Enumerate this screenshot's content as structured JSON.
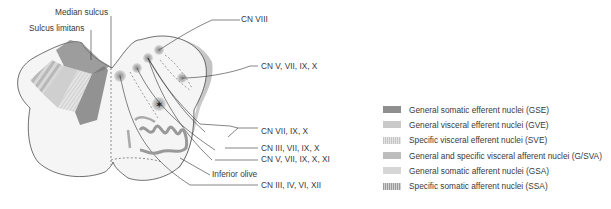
{
  "labels": {
    "median_sulcus": "Median sulcus",
    "sulcus_limitans": "Sulcus limitans",
    "cn_viii": "CN VIII",
    "cn_v_vii_ix_x": "CN V, VII, IX, X",
    "cn_vii_ix_x": "CN VII, IX, X",
    "cn_iii_vii_ix_x": "CN III, VII, IX, X",
    "cn_v_vii_ix_x_xi": "CN V, VII, IX, X, XI",
    "inferior_olive": "Inferior olive",
    "cn_iii_iv_vi_xii": "CN III, IV, VI, XII"
  },
  "legend": {
    "items": [
      {
        "label": "General somatic efferent nuclei (GSE)",
        "color": "#8f8f8f"
      },
      {
        "label": "General visceral efferent nuclei (GVE)",
        "color": "#c9c9c9"
      },
      {
        "label": "Specific visceral efferent nuclei (SVE)",
        "color": "#d5d5d5"
      },
      {
        "label": "General and specific visceral afferent nuclei (G/SVA)",
        "color": "#bdbdbd"
      },
      {
        "label": "General somatic afferent nuclei (GSA)",
        "color": "#d6d6d6"
      },
      {
        "label": "Specific somatic afferent nuclei (SSA)",
        "color": "#b5b5b5"
      }
    ]
  }
}
